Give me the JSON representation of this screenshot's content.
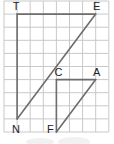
{
  "figure": {
    "type": "geometry-grid-diagram",
    "grid": {
      "columns": 8,
      "rows": 10
    },
    "points": [
      {
        "label": "T",
        "col": 1,
        "row": 1
      },
      {
        "label": "E",
        "col": 7,
        "row": 1
      },
      {
        "label": "N",
        "col": 1,
        "row": 9
      },
      {
        "label": "C",
        "col": 4,
        "row": 6
      },
      {
        "label": "A",
        "col": 7,
        "row": 6
      },
      {
        "label": "F",
        "col": 4,
        "row": 10
      }
    ],
    "segments": [
      [
        "T",
        "E"
      ],
      [
        "T",
        "N"
      ],
      [
        "E",
        "N"
      ],
      [
        "C",
        "A"
      ],
      [
        "C",
        "F"
      ],
      [
        "F",
        "A"
      ]
    ],
    "triangles": [
      "TEN",
      "CAF"
    ],
    "colors": {
      "grid": "#c9c9c9",
      "segment": "#6d6d6d",
      "label": "#222222"
    }
  }
}
